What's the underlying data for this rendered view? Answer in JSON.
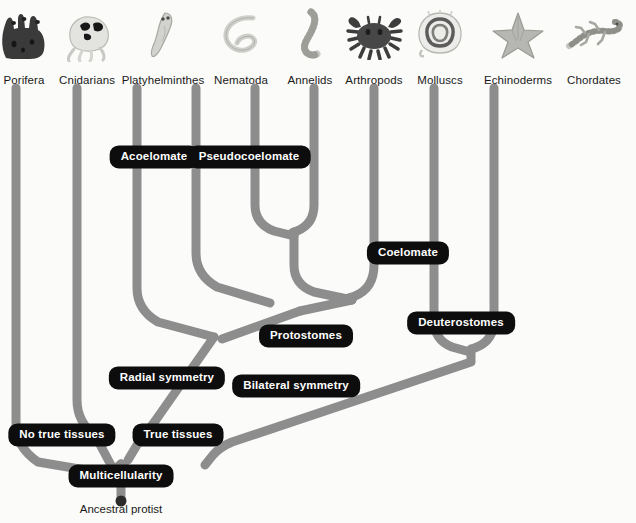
{
  "diagram": {
    "root_label": "Ancestral protist",
    "background_color": "#fbfbf9",
    "branch_color": "#8d8d8d",
    "label_box_color": "#0d0d0d",
    "label_text_color": "#ffffff",
    "taxon_text_color": "#1a1a1a"
  },
  "taxa": [
    {
      "id": "porifera",
      "label": "Porifera",
      "x": 16,
      "icon": "sponge-icon",
      "label_x": 24,
      "label_y": 74
    },
    {
      "id": "cnidarians",
      "label": "Cnidarians",
      "x": 77,
      "icon": "jellyfish-icon",
      "label_x": 87,
      "label_y": 74
    },
    {
      "id": "platyhelminthes",
      "label": "Platyhelminthes",
      "x": 137,
      "icon": "flatworm-icon",
      "label_x": 163,
      "label_y": 74
    },
    {
      "id": "nematoda",
      "label": "Nematoda",
      "x": 196,
      "icon": "roundworm-icon",
      "label_x": 241,
      "label_y": 74
    },
    {
      "id": "annelids",
      "label": "Annelids",
      "x": 255,
      "icon": "segmented-worm-icon",
      "label_x": 310,
      "label_y": 74
    },
    {
      "id": "arthropods",
      "label": "Arthropods",
      "x": 314,
      "icon": "crab-icon",
      "label_x": 374,
      "label_y": 74
    },
    {
      "id": "molluscs",
      "label": "Molluscs",
      "x": 374,
      "icon": "shell-icon",
      "label_x": 440,
      "label_y": 74
    },
    {
      "id": "echinoderms",
      "label": "Echinoderms",
      "x": 434,
      "icon": "starfish-icon",
      "label_x": 518,
      "label_y": 74
    },
    {
      "id": "chordates",
      "label": "Chordates",
      "x": 494,
      "icon": "lizard-icon",
      "label_x": 594,
      "label_y": 74
    }
  ],
  "trait_labels": [
    {
      "id": "acoelomate",
      "label": "Acoelomate",
      "x": 154,
      "y": 157
    },
    {
      "id": "pseudocoelomate",
      "label": "Pseudocoelomate",
      "x": 249,
      "y": 157
    },
    {
      "id": "coelomate",
      "label": "Coelomate",
      "x": 408,
      "y": 253
    },
    {
      "id": "protostomes",
      "label": "Protostomes",
      "x": 306,
      "y": 336
    },
    {
      "id": "deuterostomes",
      "label": "Deuterostomes",
      "x": 461,
      "y": 323
    },
    {
      "id": "radial-symmetry",
      "label": "Radial symmetry",
      "x": 167,
      "y": 378
    },
    {
      "id": "bilateral-symmetry",
      "label": "Bilateral symmetry",
      "x": 296,
      "y": 386
    },
    {
      "id": "no-true-tissues",
      "label": "No true tissues",
      "x": 62,
      "y": 435
    },
    {
      "id": "true-tissues",
      "label": "True tissues",
      "x": 178,
      "y": 435
    },
    {
      "id": "multicellularity",
      "label": "Multicellularity",
      "x": 121,
      "y": 476
    }
  ],
  "root": {
    "label": "Ancestral protist",
    "x": 121,
    "y": 503
  }
}
